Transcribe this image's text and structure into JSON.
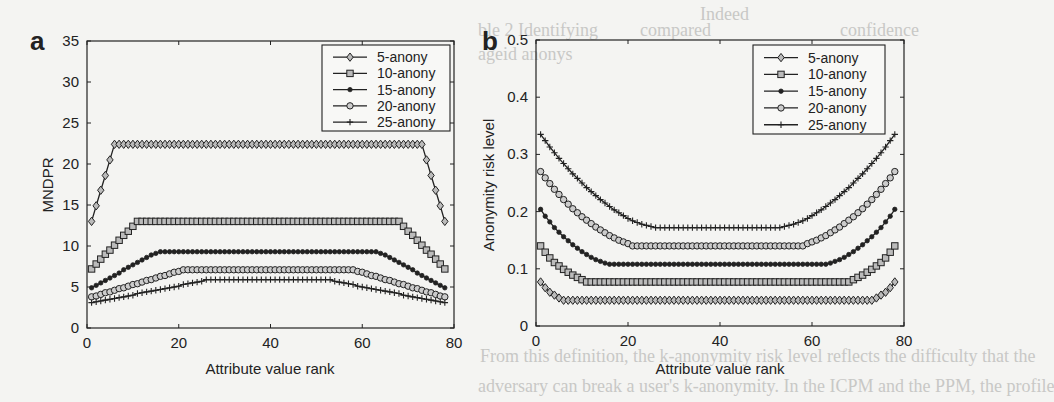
{
  "background_bleed_text": [
    "ble 2 Identifying",
    "ageid anonys",
    "compared",
    "Indeed",
    "confidence",
    "From this definition, the k-anonymity risk level reflects the difficulty that the",
    "adversary can break a user's k-anonymity. In the ICPM and the PPM, the profile"
  ],
  "chart_data": [
    {
      "panel_label": "a",
      "type": "line",
      "title": "",
      "xlabel": "Attribute value rank",
      "ylabel": "MNDPR",
      "xlim": [
        0,
        80
      ],
      "ylim": [
        0,
        35
      ],
      "xticks": [
        0,
        20,
        40,
        60,
        80
      ],
      "yticks": [
        0,
        5,
        10,
        15,
        20,
        25,
        30,
        35
      ],
      "grid": false,
      "legend_position": "top-right",
      "x": [
        1,
        2,
        3,
        4,
        5,
        6,
        7,
        8,
        9,
        10,
        11,
        12,
        13,
        14,
        15,
        16,
        17,
        18,
        19,
        20,
        21,
        22,
        23,
        24,
        25,
        26,
        27,
        28,
        29,
        30,
        31,
        32,
        33,
        34,
        35,
        36,
        37,
        38,
        39,
        40,
        41,
        42,
        43,
        44,
        45,
        46,
        47,
        48,
        49,
        50,
        51,
        52,
        53,
        54,
        55,
        56,
        57,
        58,
        59,
        60,
        61,
        62,
        63,
        64,
        65,
        66,
        67,
        68,
        69,
        70,
        71,
        72,
        73,
        74,
        75,
        76,
        77,
        78
      ],
      "series": [
        {
          "name": "5-anony",
          "marker": "diamond",
          "values": [
            13.0,
            14.9,
            16.8,
            18.6,
            20.5,
            22.4,
            22.4,
            22.4,
            22.4,
            22.4,
            22.4,
            22.4,
            22.4,
            22.4,
            22.4,
            22.4,
            22.4,
            22.4,
            22.4,
            22.4,
            22.4,
            22.4,
            22.4,
            22.4,
            22.4,
            22.4,
            22.4,
            22.4,
            22.4,
            22.4,
            22.4,
            22.4,
            22.4,
            22.4,
            22.4,
            22.4,
            22.4,
            22.4,
            22.4,
            22.4,
            22.4,
            22.4,
            22.4,
            22.4,
            22.4,
            22.4,
            22.4,
            22.4,
            22.4,
            22.4,
            22.4,
            22.4,
            22.4,
            22.4,
            22.4,
            22.4,
            22.4,
            22.4,
            22.4,
            22.4,
            22.4,
            22.4,
            22.4,
            22.4,
            22.4,
            22.4,
            22.4,
            22.4,
            22.4,
            22.4,
            22.4,
            22.4,
            22.4,
            20.5,
            18.6,
            16.8,
            14.9,
            13.0
          ]
        },
        {
          "name": "10-anony",
          "marker": "square",
          "values": [
            7.2,
            7.8,
            8.4,
            9.0,
            9.5,
            10.1,
            10.7,
            11.3,
            11.8,
            12.4,
            13.0,
            13.0,
            13.0,
            13.0,
            13.0,
            13.0,
            13.0,
            13.0,
            13.0,
            13.0,
            13.0,
            13.0,
            13.0,
            13.0,
            13.0,
            13.0,
            13.0,
            13.0,
            13.0,
            13.0,
            13.0,
            13.0,
            13.0,
            13.0,
            13.0,
            13.0,
            13.0,
            13.0,
            13.0,
            13.0,
            13.0,
            13.0,
            13.0,
            13.0,
            13.0,
            13.0,
            13.0,
            13.0,
            13.0,
            13.0,
            13.0,
            13.0,
            13.0,
            13.0,
            13.0,
            13.0,
            13.0,
            13.0,
            13.0,
            13.0,
            13.0,
            13.0,
            13.0,
            13.0,
            13.0,
            13.0,
            13.0,
            13.0,
            12.4,
            11.8,
            11.3,
            10.7,
            10.1,
            9.5,
            9.0,
            8.4,
            7.8,
            7.2
          ]
        },
        {
          "name": "15-anony",
          "marker": "dot",
          "values": [
            4.9,
            5.2,
            5.5,
            5.8,
            6.1,
            6.4,
            6.7,
            7.1,
            7.4,
            7.7,
            8.0,
            8.3,
            8.6,
            8.9,
            9.1,
            9.3,
            9.3,
            9.3,
            9.3,
            9.3,
            9.3,
            9.3,
            9.3,
            9.3,
            9.3,
            9.3,
            9.3,
            9.3,
            9.3,
            9.3,
            9.3,
            9.3,
            9.3,
            9.3,
            9.3,
            9.3,
            9.3,
            9.3,
            9.3,
            9.3,
            9.3,
            9.3,
            9.3,
            9.3,
            9.3,
            9.3,
            9.3,
            9.3,
            9.3,
            9.3,
            9.3,
            9.3,
            9.3,
            9.3,
            9.3,
            9.3,
            9.3,
            9.3,
            9.3,
            9.3,
            9.3,
            9.3,
            9.3,
            9.1,
            8.9,
            8.6,
            8.3,
            8.0,
            7.7,
            7.4,
            7.1,
            6.7,
            6.4,
            6.1,
            5.8,
            5.5,
            5.2,
            4.9
          ]
        },
        {
          "name": "20-anony",
          "marker": "circle",
          "values": [
            3.8,
            3.9,
            4.1,
            4.3,
            4.4,
            4.6,
            4.8,
            4.9,
            5.1,
            5.3,
            5.4,
            5.6,
            5.8,
            5.9,
            6.1,
            6.3,
            6.4,
            6.6,
            6.8,
            6.9,
            7.1,
            7.1,
            7.1,
            7.1,
            7.1,
            7.1,
            7.1,
            7.1,
            7.1,
            7.1,
            7.1,
            7.1,
            7.1,
            7.1,
            7.1,
            7.1,
            7.1,
            7.1,
            7.1,
            7.1,
            7.1,
            7.1,
            7.1,
            7.1,
            7.1,
            7.1,
            7.1,
            7.1,
            7.1,
            7.1,
            7.1,
            7.1,
            7.1,
            7.1,
            7.1,
            7.1,
            7.1,
            7.1,
            6.9,
            6.8,
            6.6,
            6.4,
            6.3,
            6.1,
            5.9,
            5.8,
            5.6,
            5.4,
            5.3,
            5.1,
            4.9,
            4.8,
            4.6,
            4.4,
            4.3,
            4.1,
            3.9,
            3.8
          ]
        },
        {
          "name": "25-anony",
          "marker": "plus",
          "values": [
            3.1,
            3.2,
            3.3,
            3.4,
            3.5,
            3.6,
            3.7,
            3.8,
            3.9,
            4.0,
            4.2,
            4.3,
            4.4,
            4.5,
            4.6,
            4.7,
            4.8,
            4.9,
            5.0,
            5.1,
            5.3,
            5.4,
            5.5,
            5.6,
            5.7,
            5.9,
            5.9,
            5.9,
            5.9,
            5.9,
            5.9,
            5.9,
            5.9,
            5.9,
            5.9,
            5.9,
            5.9,
            5.9,
            5.9,
            5.9,
            5.9,
            5.9,
            5.9,
            5.9,
            5.9,
            5.9,
            5.9,
            5.9,
            5.9,
            5.9,
            5.9,
            5.9,
            5.9,
            5.7,
            5.6,
            5.5,
            5.4,
            5.3,
            5.1,
            5.0,
            4.9,
            4.8,
            4.7,
            4.6,
            4.5,
            4.4,
            4.3,
            4.2,
            4.0,
            3.9,
            3.8,
            3.7,
            3.6,
            3.5,
            3.4,
            3.3,
            3.2,
            3.1
          ]
        }
      ]
    },
    {
      "panel_label": "b",
      "type": "line",
      "title": "",
      "xlabel": "Attribute value rank",
      "ylabel": "Anonymity risk level",
      "xlim": [
        0,
        80
      ],
      "ylim": [
        0,
        0.5
      ],
      "xticks": [
        0,
        20,
        40,
        60,
        80
      ],
      "yticks": [
        0,
        0.1,
        0.2,
        0.3,
        0.4,
        0.5
      ],
      "grid": false,
      "legend_position": "top-right",
      "x": [
        1,
        2,
        3,
        4,
        5,
        6,
        7,
        8,
        9,
        10,
        11,
        12,
        13,
        14,
        15,
        16,
        17,
        18,
        19,
        20,
        21,
        22,
        23,
        24,
        25,
        26,
        27,
        28,
        29,
        30,
        31,
        32,
        33,
        34,
        35,
        36,
        37,
        38,
        39,
        40,
        41,
        42,
        43,
        44,
        45,
        46,
        47,
        48,
        49,
        50,
        51,
        52,
        53,
        54,
        55,
        56,
        57,
        58,
        59,
        60,
        61,
        62,
        63,
        64,
        65,
        66,
        67,
        68,
        69,
        70,
        71,
        72,
        73,
        74,
        75,
        76,
        77,
        78
      ],
      "series": [
        {
          "name": "5-anony",
          "marker": "diamond",
          "values": [
            0.077,
            0.067,
            0.059,
            0.054,
            0.049,
            0.045,
            0.045,
            0.045,
            0.045,
            0.045,
            0.045,
            0.045,
            0.045,
            0.045,
            0.045,
            0.045,
            0.045,
            0.045,
            0.045,
            0.045,
            0.045,
            0.045,
            0.045,
            0.045,
            0.045,
            0.045,
            0.045,
            0.045,
            0.045,
            0.045,
            0.045,
            0.045,
            0.045,
            0.045,
            0.045,
            0.045,
            0.045,
            0.045,
            0.045,
            0.045,
            0.045,
            0.045,
            0.045,
            0.045,
            0.045,
            0.045,
            0.045,
            0.045,
            0.045,
            0.045,
            0.045,
            0.045,
            0.045,
            0.045,
            0.045,
            0.045,
            0.045,
            0.045,
            0.045,
            0.045,
            0.045,
            0.045,
            0.045,
            0.045,
            0.045,
            0.045,
            0.045,
            0.045,
            0.045,
            0.045,
            0.045,
            0.045,
            0.045,
            0.049,
            0.054,
            0.059,
            0.067,
            0.077
          ]
        },
        {
          "name": "10-anony",
          "marker": "square",
          "values": [
            0.14,
            0.129,
            0.119,
            0.111,
            0.105,
            0.099,
            0.094,
            0.089,
            0.085,
            0.081,
            0.077,
            0.077,
            0.077,
            0.077,
            0.077,
            0.077,
            0.077,
            0.077,
            0.077,
            0.077,
            0.077,
            0.077,
            0.077,
            0.077,
            0.077,
            0.077,
            0.077,
            0.077,
            0.077,
            0.077,
            0.077,
            0.077,
            0.077,
            0.077,
            0.077,
            0.077,
            0.077,
            0.077,
            0.077,
            0.077,
            0.077,
            0.077,
            0.077,
            0.077,
            0.077,
            0.077,
            0.077,
            0.077,
            0.077,
            0.077,
            0.077,
            0.077,
            0.077,
            0.077,
            0.077,
            0.077,
            0.077,
            0.077,
            0.077,
            0.077,
            0.077,
            0.077,
            0.077,
            0.077,
            0.077,
            0.077,
            0.077,
            0.077,
            0.081,
            0.085,
            0.089,
            0.094,
            0.099,
            0.105,
            0.111,
            0.119,
            0.129,
            0.14
          ]
        },
        {
          "name": "15-anony",
          "marker": "dot",
          "values": [
            0.204,
            0.192,
            0.182,
            0.172,
            0.164,
            0.156,
            0.149,
            0.142,
            0.136,
            0.13,
            0.125,
            0.12,
            0.116,
            0.113,
            0.11,
            0.108,
            0.108,
            0.108,
            0.108,
            0.108,
            0.108,
            0.108,
            0.108,
            0.108,
            0.108,
            0.108,
            0.108,
            0.108,
            0.108,
            0.108,
            0.108,
            0.108,
            0.108,
            0.108,
            0.108,
            0.108,
            0.108,
            0.108,
            0.108,
            0.108,
            0.108,
            0.108,
            0.108,
            0.108,
            0.108,
            0.108,
            0.108,
            0.108,
            0.108,
            0.108,
            0.108,
            0.108,
            0.108,
            0.108,
            0.108,
            0.108,
            0.108,
            0.108,
            0.108,
            0.108,
            0.108,
            0.108,
            0.108,
            0.11,
            0.113,
            0.116,
            0.12,
            0.125,
            0.13,
            0.136,
            0.142,
            0.149,
            0.156,
            0.164,
            0.172,
            0.182,
            0.192,
            0.204
          ]
        },
        {
          "name": "20-anony",
          "marker": "circle",
          "values": [
            0.27,
            0.259,
            0.249,
            0.239,
            0.23,
            0.221,
            0.213,
            0.205,
            0.198,
            0.191,
            0.185,
            0.179,
            0.173,
            0.168,
            0.163,
            0.158,
            0.154,
            0.15,
            0.147,
            0.144,
            0.14,
            0.14,
            0.14,
            0.14,
            0.14,
            0.14,
            0.14,
            0.14,
            0.14,
            0.14,
            0.14,
            0.14,
            0.14,
            0.14,
            0.14,
            0.14,
            0.14,
            0.14,
            0.14,
            0.14,
            0.14,
            0.14,
            0.14,
            0.14,
            0.14,
            0.14,
            0.14,
            0.14,
            0.14,
            0.14,
            0.14,
            0.14,
            0.14,
            0.14,
            0.14,
            0.14,
            0.14,
            0.14,
            0.144,
            0.147,
            0.15,
            0.154,
            0.158,
            0.163,
            0.168,
            0.173,
            0.179,
            0.185,
            0.191,
            0.198,
            0.205,
            0.213,
            0.221,
            0.23,
            0.239,
            0.249,
            0.259,
            0.27
          ]
        },
        {
          "name": "25-anony",
          "marker": "plus",
          "values": [
            0.335,
            0.324,
            0.313,
            0.303,
            0.293,
            0.284,
            0.275,
            0.266,
            0.258,
            0.25,
            0.242,
            0.235,
            0.228,
            0.221,
            0.215,
            0.209,
            0.203,
            0.198,
            0.193,
            0.188,
            0.184,
            0.181,
            0.178,
            0.176,
            0.174,
            0.172,
            0.172,
            0.172,
            0.172,
            0.172,
            0.172,
            0.172,
            0.172,
            0.172,
            0.172,
            0.172,
            0.172,
            0.172,
            0.172,
            0.172,
            0.172,
            0.172,
            0.172,
            0.172,
            0.172,
            0.172,
            0.172,
            0.172,
            0.172,
            0.172,
            0.172,
            0.172,
            0.172,
            0.174,
            0.176,
            0.178,
            0.181,
            0.184,
            0.188,
            0.193,
            0.198,
            0.203,
            0.209,
            0.215,
            0.221,
            0.228,
            0.235,
            0.242,
            0.25,
            0.258,
            0.266,
            0.275,
            0.284,
            0.293,
            0.303,
            0.313,
            0.324,
            0.335
          ]
        }
      ]
    }
  ]
}
